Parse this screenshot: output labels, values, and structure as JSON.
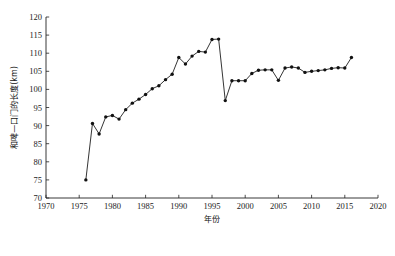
{
  "chart_data": {
    "type": "line",
    "title": "",
    "xlabel": "年份",
    "ylabel": "和啤—口门的长度(km)",
    "xlim": [
      1970,
      2020
    ],
    "ylim": [
      70,
      120
    ],
    "xticks": [
      1970,
      1975,
      1980,
      1985,
      1990,
      1995,
      2000,
      2005,
      2010,
      2015,
      2020
    ],
    "yticks": [
      70,
      75,
      80,
      85,
      90,
      95,
      100,
      105,
      110,
      115,
      120
    ],
    "grid": false,
    "legend": null,
    "marker": "filled-circle",
    "x": [
      1976,
      1977,
      1978,
      1979,
      1980,
      1981,
      1982,
      1983,
      1984,
      1985,
      1986,
      1987,
      1988,
      1989,
      1990,
      1991,
      1992,
      1993,
      1994,
      1995,
      1996,
      1997,
      1998,
      1999,
      2000,
      2001,
      2002,
      2003,
      2004,
      2005,
      2006,
      2007,
      2008,
      2009,
      2010,
      2011,
      2012,
      2013,
      2014,
      2015,
      2016
    ],
    "values": [
      75.0,
      90.6,
      87.7,
      92.4,
      92.8,
      91.8,
      94.4,
      96.2,
      97.3,
      98.6,
      100.2,
      101.0,
      102.7,
      104.2,
      108.8,
      107.0,
      109.2,
      110.5,
      110.3,
      113.8,
      113.9,
      96.9,
      102.4,
      102.4,
      102.4,
      104.4,
      105.3,
      105.4,
      105.4,
      102.5,
      105.9,
      106.2,
      105.9,
      104.7,
      105.0,
      105.2,
      105.4,
      105.8,
      106.0,
      105.9,
      108.8
    ]
  },
  "axes": {
    "x_tick_labels": [
      "1970",
      "1975",
      "1980",
      "1985",
      "1990",
      "1995",
      "2000",
      "2005",
      "2010",
      "2015",
      "2020"
    ],
    "y_tick_labels": [
      "70",
      "75",
      "80",
      "85",
      "90",
      "95",
      "100",
      "105",
      "110",
      "115",
      "120"
    ]
  }
}
